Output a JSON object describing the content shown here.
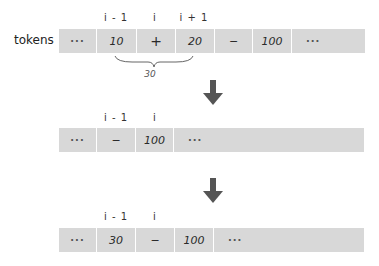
{
  "rows": [
    {
      "label": "tokens",
      "indices": [
        {
          "text": "i - 1",
          "x": 116
        },
        {
          "text": "i",
          "x": 155
        },
        {
          "text": "i + 1",
          "x": 194
        }
      ],
      "cells": [
        "···",
        "10",
        "+",
        "20",
        "−",
        "100",
        "···"
      ]
    },
    {
      "label": "",
      "indices": [
        {
          "text": "i - 1",
          "x": 116
        },
        {
          "text": "i",
          "x": 155
        }
      ],
      "cells": [
        "···",
        "−",
        "100",
        "···"
      ]
    },
    {
      "label": "",
      "indices": [
        {
          "text": "i - 1",
          "x": 116
        },
        {
          "text": "i",
          "x": 155
        }
      ],
      "cells": [
        "···",
        "30",
        "−",
        "100",
        "···"
      ]
    }
  ],
  "brace": {
    "label": "30"
  },
  "colors": {
    "cell": "#d8d8d8",
    "arrow": "#555555"
  }
}
